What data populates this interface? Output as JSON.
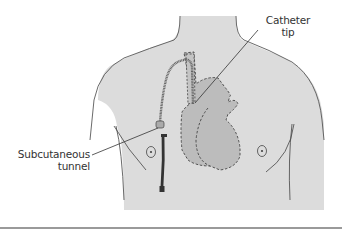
{
  "figure": {
    "labels": {
      "catheter_tip_line1": "Catheter",
      "catheter_tip_line2": "tip",
      "subcutaneous_line1": "Subcutaneous",
      "subcutaneous_line2": "tunnel"
    },
    "colors": {
      "skin": "#dddddd",
      "heart": "#bdbdbd",
      "outline": "#444444",
      "background": "#ffffff",
      "rule": "#9a9a9a"
    }
  }
}
